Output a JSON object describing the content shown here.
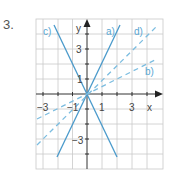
{
  "exercise": {
    "number": "3."
  },
  "axes": {
    "x_label": "x",
    "y_label": "y",
    "x_ticks": [
      {
        "value": -3,
        "label": "−3"
      },
      {
        "value": -1,
        "label": "−1"
      },
      {
        "value": 1,
        "label": "1"
      },
      {
        "value": 3,
        "label": "3"
      }
    ],
    "y_ticks": [
      {
        "value": 3,
        "label": "3"
      },
      {
        "value": 1,
        "label": "1"
      },
      {
        "value": -3,
        "label": "−3"
      }
    ],
    "x_range": [
      -3.5,
      5
    ],
    "y_range": [
      -5,
      5
    ]
  },
  "lines": [
    {
      "label": "a)",
      "equation": "y = 2x",
      "style": "solid",
      "color": "#4a9acb"
    },
    {
      "label": "b)",
      "equation": "y = 0.5x",
      "style": "dashed",
      "color": "#7cbde0"
    },
    {
      "label": "c)",
      "equation": "y = -2x",
      "style": "solid",
      "color": "#4a9acb"
    },
    {
      "label": "d)",
      "equation": "y = x",
      "style": "dashed",
      "color": "#7cbde0"
    }
  ],
  "colors": {
    "grid": "#c9c9c9",
    "axis": "#333333",
    "line": "#4a9acb",
    "dashed": "#7cbde0"
  }
}
